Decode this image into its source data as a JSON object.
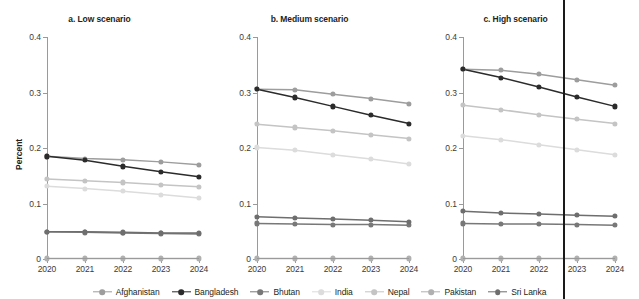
{
  "chart_data": {
    "type": "line",
    "title": "",
    "ylabel": "Percent",
    "xlabel": "",
    "x": [
      2020,
      2021,
      2022,
      2023,
      2024
    ],
    "xlim": [
      2020,
      2024
    ],
    "ylim": [
      0,
      0.4
    ],
    "yticks": [
      0,
      0.1,
      0.2,
      0.3,
      0.4
    ],
    "ytick_labels": [
      "0",
      "0.1",
      "0.2",
      "0.3",
      "0.4"
    ],
    "xtick_labels": [
      "2020",
      "2021",
      "2022",
      "2023",
      "2024"
    ],
    "grid": false,
    "legend_position": "bottom",
    "panels": [
      {
        "id": "a",
        "title": "a. Low scenario",
        "series": [
          {
            "name": "Afghanistan",
            "color": "#9d9d9d",
            "values": [
              0.185,
              0.181,
              0.179,
              0.175,
              0.17
            ]
          },
          {
            "name": "Bangladesh",
            "color": "#2b2b2b",
            "values": [
              0.185,
              0.178,
              0.167,
              0.157,
              0.148
            ]
          },
          {
            "name": "Bhutan",
            "color": "#787878",
            "values": [
              0.049,
              0.048,
              0.047,
              0.046,
              0.045
            ]
          },
          {
            "name": "India",
            "color": "#dcdcdc",
            "values": [
              0.131,
              0.127,
              0.122,
              0.116,
              0.11
            ]
          },
          {
            "name": "Nepal",
            "color": "#c4c4c4",
            "values": [
              0.144,
              0.141,
              0.138,
              0.134,
              0.13
            ]
          },
          {
            "name": "Pakistan",
            "color": "#b0b0b0",
            "values": [
              0.001,
              0.001,
              0.001,
              0.001,
              0.001
            ]
          },
          {
            "name": "Sri Lanka",
            "color": "#6e6e6e",
            "values": [
              0.049,
              0.049,
              0.048,
              0.047,
              0.047
            ]
          }
        ]
      },
      {
        "id": "b",
        "title": "b. Medium scenario",
        "series": [
          {
            "name": "Afghanistan",
            "color": "#9d9d9d",
            "values": [
              0.306,
              0.305,
              0.297,
              0.289,
              0.28
            ]
          },
          {
            "name": "Bangladesh",
            "color": "#2b2b2b",
            "values": [
              0.306,
              0.291,
              0.275,
              0.259,
              0.244
            ]
          },
          {
            "name": "Bhutan",
            "color": "#787878",
            "values": [
              0.064,
              0.063,
              0.062,
              0.062,
              0.061
            ]
          },
          {
            "name": "India",
            "color": "#dcdcdc",
            "values": [
              0.201,
              0.196,
              0.188,
              0.18,
              0.171
            ]
          },
          {
            "name": "Nepal",
            "color": "#c4c4c4",
            "values": [
              0.243,
              0.237,
              0.231,
              0.224,
              0.217
            ]
          },
          {
            "name": "Pakistan",
            "color": "#b0b0b0",
            "values": [
              0.001,
              0.001,
              0.001,
              0.001,
              0.001
            ]
          },
          {
            "name": "Sri Lanka",
            "color": "#6e6e6e",
            "values": [
              0.076,
              0.074,
              0.072,
              0.07,
              0.067
            ]
          }
        ]
      },
      {
        "id": "c",
        "title": "c. High scenario",
        "series": [
          {
            "name": "Afghanistan",
            "color": "#9d9d9d",
            "values": [
              0.342,
              0.34,
              0.333,
              0.323,
              0.313
            ]
          },
          {
            "name": "Bangladesh",
            "color": "#2b2b2b",
            "values": [
              0.342,
              0.327,
              0.31,
              0.292,
              0.275
            ]
          },
          {
            "name": "Bhutan",
            "color": "#787878",
            "values": [
              0.064,
              0.063,
              0.063,
              0.062,
              0.061
            ]
          },
          {
            "name": "India",
            "color": "#dcdcdc",
            "values": [
              0.222,
              0.215,
              0.206,
              0.197,
              0.188
            ]
          },
          {
            "name": "Nepal",
            "color": "#c4c4c4",
            "values": [
              0.277,
              0.269,
              0.26,
              0.252,
              0.244
            ]
          },
          {
            "name": "Pakistan",
            "color": "#b0b0b0",
            "values": [
              0.001,
              0.001,
              0.001,
              0.001,
              0.001
            ]
          },
          {
            "name": "Sri Lanka",
            "color": "#6e6e6e",
            "values": [
              0.086,
              0.083,
              0.081,
              0.079,
              0.077
            ]
          }
        ]
      }
    ],
    "legend": [
      {
        "label": "Afghanistan",
        "color": "#9d9d9d"
      },
      {
        "label": "Bangladesh",
        "color": "#2b2b2b"
      },
      {
        "label": "Bhutan",
        "color": "#787878"
      },
      {
        "label": "India",
        "color": "#dcdcdc"
      },
      {
        "label": "Nepal",
        "color": "#c4c4c4"
      },
      {
        "label": "Pakistan",
        "color": "#b0b0b0"
      },
      {
        "label": "Sri Lanka",
        "color": "#6e6e6e"
      }
    ],
    "annotations": [
      {
        "type": "vertical-rule",
        "color": "#1a1a1a",
        "x_px": 563
      }
    ]
  }
}
